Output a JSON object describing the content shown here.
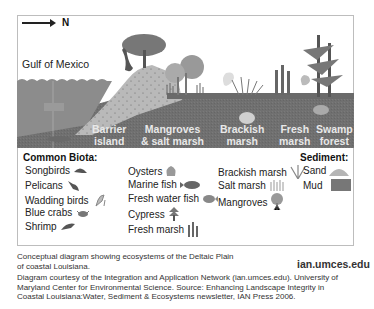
{
  "diagram": {
    "orientation": {
      "arrow_label": "N",
      "direction": "right"
    },
    "water_label": "Gulf of Mexico",
    "zones": [
      {
        "id": "barrier-island",
        "line1": "Barrier",
        "line2": "island"
      },
      {
        "id": "mangroves-salt-marsh",
        "line1": "Mangroves",
        "line2": "& salt marsh"
      },
      {
        "id": "brackish-marsh",
        "line1": "Brackish",
        "line2": "marsh"
      },
      {
        "id": "fresh-marsh",
        "line1": "Fresh",
        "line2": "marsh"
      },
      {
        "id": "swamp-forest",
        "line1": "Swamp",
        "line2": "forest"
      }
    ],
    "colors": {
      "sky": "#ffffff",
      "water": "#8a8a8a",
      "ground": "#6f6f6f",
      "sand": "#bdbdbd",
      "vegetation": "#7a7a7a",
      "zone_label": "#e8e8e8"
    }
  },
  "legend": {
    "biota_title": "Common Biota:",
    "sediment_title": "Sediment:",
    "biota_columns": [
      [
        {
          "label": "Songbirds",
          "icon": "songbird-icon"
        },
        {
          "label": "Pelicans",
          "icon": "pelican-icon"
        },
        {
          "label": "Wadding birds",
          "icon": "wading-bird-icon"
        },
        {
          "label": "Blue crabs",
          "icon": "crab-icon"
        },
        {
          "label": "Shrimp",
          "icon": "shrimp-icon"
        }
      ],
      [
        {
          "label": "Oysters",
          "icon": "oyster-icon"
        },
        {
          "label": "Marine fish",
          "icon": "marine-fish-icon"
        },
        {
          "label": "Fresh water fish",
          "icon": "freshwater-fish-icon"
        },
        {
          "label": "Cypress",
          "icon": "cypress-icon"
        },
        {
          "label": "Fresh marsh",
          "icon": "fresh-marsh-icon"
        }
      ],
      [
        {
          "label": "Brackish marsh",
          "icon": "brackish-marsh-icon"
        },
        {
          "label": "Salt marsh",
          "icon": "salt-marsh-icon"
        },
        {
          "label": "Mangroves",
          "icon": "mangrove-icon"
        }
      ]
    ],
    "sediment": [
      {
        "label": "Sand",
        "icon": "sand-icon"
      },
      {
        "label": "Mud",
        "icon": "mud-icon"
      }
    ]
  },
  "caption": {
    "line1": "Conceptual diagram showing ecosystems of the Deltaic Plain",
    "line2": "of coastal Louisiana.",
    "credit1": "Diagram courtesy of the Integration and Application Network (ian.umces.edu). University of",
    "credit2": "Maryland Center for Environmental Science. Source: Enhancing Landscape Integrity in",
    "credit3": "Coastal Louisiana:Water, Sediment & Ecosystems newsletter, IAN Press 2006."
  },
  "brand": "ian.umces.edu"
}
